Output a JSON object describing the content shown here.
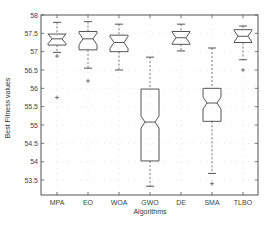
{
  "chart_data": {
    "type": "boxplot",
    "title": "",
    "xlabel": "Algorithms",
    "ylabel": "Best Fitness values",
    "ylim": [
      53.1,
      58.0
    ],
    "yticks": [
      58,
      57.5,
      57,
      56.5,
      56,
      55.5,
      55,
      54.5,
      54,
      53.5
    ],
    "ytick_labels": [
      "58",
      "57.5",
      "57",
      "56.5",
      "56",
      "55.5",
      "55",
      "54.5",
      "54",
      "53.5"
    ],
    "grid": true,
    "notched": true,
    "categories": [
      "MPA",
      "EO",
      "WOA",
      "GWO",
      "DE",
      "SMA",
      "TLBO"
    ],
    "series": [
      {
        "name": "MPA",
        "whisker_high": 57.8,
        "q3": 57.48,
        "median": 57.35,
        "q1": 57.18,
        "whisker_low": 56.98,
        "outliers": [
          56.88,
          55.75
        ]
      },
      {
        "name": "EO",
        "whisker_high": 57.82,
        "q3": 57.55,
        "median": 57.35,
        "q1": 57.05,
        "whisker_low": 56.55,
        "outliers": [
          56.2
        ]
      },
      {
        "name": "WOA",
        "whisker_high": 57.75,
        "q3": 57.45,
        "median": 57.25,
        "q1": 57.0,
        "whisker_low": 56.5,
        "outliers": []
      },
      {
        "name": "GWO",
        "whisker_high": 56.85,
        "q3": 55.98,
        "median": 55.08,
        "q1": 54.02,
        "whisker_low": 53.33,
        "outliers": []
      },
      {
        "name": "DE",
        "whisker_high": 57.75,
        "q3": 57.55,
        "median": 57.38,
        "q1": 57.2,
        "whisker_low": 57.02,
        "outliers": []
      },
      {
        "name": "SMA",
        "whisker_high": 57.1,
        "q3": 56.0,
        "median": 55.6,
        "q1": 55.1,
        "whisker_low": 53.68,
        "outliers": [
          53.4
        ]
      },
      {
        "name": "TLBO",
        "whisker_high": 57.7,
        "q3": 57.6,
        "median": 57.42,
        "q1": 57.25,
        "whisker_low": 56.78,
        "outliers": [
          56.5
        ]
      }
    ]
  },
  "colors": {
    "box": "#555555",
    "axis": "#555555",
    "grid": "#dddddd"
  }
}
